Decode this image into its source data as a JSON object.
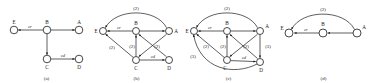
{
  "figure": {
    "type": "multi-panel-graph-diagram",
    "panel_count": 4,
    "colors": {
      "background": "#ffffff",
      "stroke": "#1a1a1a",
      "node_fill": "#ffffff",
      "text": "#1a1a1a"
    },
    "node_names": [
      "A",
      "B",
      "C",
      "D",
      "E"
    ],
    "edge_label_names": [
      "cr",
      "cd"
    ],
    "weight_values": [
      "(2)",
      "(3)"
    ]
  },
  "panels": [
    {
      "id": "a",
      "caption": "(a)",
      "nodes": [
        {
          "id": "E",
          "label": "E",
          "x": 14,
          "y": 30
        },
        {
          "id": "B",
          "label": "B",
          "x": 47,
          "y": 30
        },
        {
          "id": "A",
          "label": "A",
          "x": 79,
          "y": 30
        },
        {
          "id": "C",
          "label": "C",
          "x": 47,
          "y": 59
        },
        {
          "id": "D",
          "label": "D",
          "x": 79,
          "y": 59
        }
      ],
      "edges": [
        {
          "from": "B",
          "to": "E",
          "label": "cr",
          "weight": ""
        },
        {
          "from": "B",
          "to": "A",
          "label": "",
          "weight": ""
        },
        {
          "from": "B",
          "to": "C",
          "label": "",
          "weight": ""
        },
        {
          "from": "C",
          "to": "D",
          "label": "cd",
          "weight": ""
        }
      ]
    },
    {
      "id": "b",
      "caption": "(b)",
      "nodes": [
        {
          "id": "E",
          "label": "E",
          "x": 13,
          "y": 31
        },
        {
          "id": "B",
          "label": "B",
          "x": 46,
          "y": 31
        },
        {
          "id": "A",
          "label": "A",
          "x": 79,
          "y": 31
        },
        {
          "id": "C",
          "label": "C",
          "x": 46,
          "y": 60
        },
        {
          "id": "D",
          "label": "D",
          "x": 79,
          "y": 60
        }
      ],
      "edges": [
        {
          "from": "B",
          "to": "E",
          "label": "cr",
          "weight": ""
        },
        {
          "from": "B",
          "to": "A",
          "label": "",
          "weight": ""
        },
        {
          "from": "A",
          "to": "E",
          "label": "",
          "weight": "(2)"
        },
        {
          "from": "C",
          "to": "B",
          "label": "",
          "weight": "(2)"
        },
        {
          "from": "C",
          "to": "E",
          "label": "",
          "weight": "(2)"
        },
        {
          "from": "C",
          "to": "D",
          "label": "cd",
          "weight": ""
        },
        {
          "from": "D",
          "to": "B",
          "label": "",
          "weight": "(2)"
        },
        {
          "from": "A",
          "to": "C",
          "label": "",
          "weight": ""
        }
      ],
      "weights_shown": [
        "(2)",
        "(2)",
        "(2)",
        "(2)"
      ]
    },
    {
      "id": "c",
      "caption": "(c)",
      "nodes": [
        {
          "id": "E",
          "label": "E",
          "x": 12,
          "y": 31
        },
        {
          "id": "B",
          "label": "B",
          "x": 45,
          "y": 31
        },
        {
          "id": "A",
          "label": "A",
          "x": 78,
          "y": 31
        },
        {
          "id": "C",
          "label": "C",
          "x": 45,
          "y": 60
        },
        {
          "id": "D",
          "label": "D",
          "x": 78,
          "y": 62
        }
      ],
      "edges": [
        {
          "from": "B",
          "to": "E",
          "label": "cr",
          "weight": ""
        },
        {
          "from": "B",
          "to": "A",
          "label": "",
          "weight": ""
        },
        {
          "from": "A",
          "to": "E",
          "label": "",
          "weight": "(2)"
        },
        {
          "from": "C",
          "to": "B",
          "label": "",
          "weight": "(2)"
        },
        {
          "from": "C",
          "to": "E",
          "label": "",
          "weight": "(2)"
        },
        {
          "from": "D",
          "to": "E",
          "label": "",
          "weight": "(3)"
        },
        {
          "from": "C",
          "to": "D",
          "label": "cd",
          "weight": ""
        },
        {
          "from": "D",
          "to": "B",
          "label": "",
          "weight": "(2)"
        },
        {
          "from": "A",
          "to": "D",
          "label": "",
          "weight": "(3)"
        },
        {
          "from": "A",
          "to": "C",
          "label": "",
          "weight": ""
        }
      ],
      "weights_shown": [
        "(2)",
        "(2)",
        "(2)",
        "(2)",
        "(3)",
        "(3)"
      ]
    },
    {
      "id": "d",
      "caption": "(d)",
      "nodes": [
        {
          "id": "E",
          "label": "E",
          "x": 13,
          "y": 33
        },
        {
          "id": "B",
          "label": "B",
          "x": 47,
          "y": 33
        },
        {
          "id": "A",
          "label": "A",
          "x": 81,
          "y": 33
        }
      ],
      "edges": [
        {
          "from": "B",
          "to": "E",
          "label": "cr",
          "weight": ""
        },
        {
          "from": "A",
          "to": "B",
          "label": "",
          "weight": ""
        },
        {
          "from": "A",
          "to": "E",
          "label": "",
          "weight": "(2)"
        }
      ],
      "weights_shown": [
        "(2)"
      ]
    }
  ]
}
